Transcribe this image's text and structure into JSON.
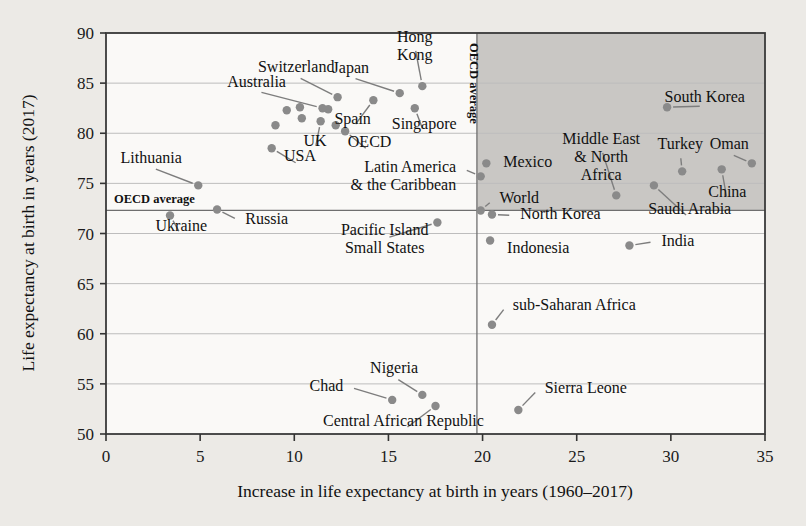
{
  "chart_data": {
    "type": "scatter",
    "title": "",
    "xlabel": "Increase in life expectancy at birth in years (1960–2017)",
    "ylabel": "Life expectancy at birth in years (2017)",
    "xlim": [
      0,
      35
    ],
    "ylim": [
      50,
      90
    ],
    "xticks": [
      0,
      5,
      10,
      15,
      20,
      25,
      30,
      35
    ],
    "yticks": [
      50,
      55,
      60,
      65,
      70,
      75,
      80,
      85,
      90
    ],
    "xtick_labels": [
      "0",
      "5",
      "10",
      "15",
      "20",
      "25",
      "30",
      "35"
    ],
    "ytick_labels": [
      "50",
      "55",
      "60",
      "65",
      "70",
      "75",
      "80",
      "85",
      "90"
    ],
    "grid": "horizontal",
    "legend": "none",
    "reference_lines": [
      {
        "name": "OECD average vertical",
        "axis": "x",
        "value": 19.7,
        "label": "OECD average"
      },
      {
        "name": "OECD average horizontal",
        "axis": "y",
        "value": 72.3,
        "label": "OECD average"
      }
    ],
    "shaded_region": {
      "label": "above both OECD averages",
      "x_range": [
        19.7,
        35
      ],
      "y_range": [
        72.3,
        90
      ],
      "color": "#c9c7c4"
    },
    "points": [
      {
        "label": "Hong Kong",
        "x": 16.8,
        "y": 84.7,
        "lx": 16.4,
        "ly": 89.1,
        "lx2": 16.4,
        "ly2": 87.3,
        "anchor": "middle",
        "l2": "Kong",
        "l1": "Hong"
      },
      {
        "label": "Japan",
        "x": 15.6,
        "y": 84.0,
        "lx": 13.0,
        "ly": 86.0,
        "anchor": "middle"
      },
      {
        "label": "Switzerland",
        "x": 12.3,
        "y": 83.6,
        "lx": 10.1,
        "ly": 86.1,
        "anchor": "middle"
      },
      {
        "label": "Spain",
        "x": 14.2,
        "y": 83.3,
        "lx": 13.1,
        "ly": 80.9,
        "anchor": "middle"
      },
      {
        "label": "Australia",
        "x": 11.5,
        "y": 82.5,
        "lx": 8.0,
        "ly": 84.6,
        "anchor": "middle"
      },
      {
        "label": "South Korea",
        "x": 29.8,
        "y": 82.6,
        "lx": 31.8,
        "ly": 83.1,
        "anchor": "middle"
      },
      {
        "label": "Singapore",
        "x": 16.4,
        "y": 82.5,
        "lx": 16.9,
        "ly": 80.4,
        "anchor": "middle"
      },
      {
        "label": "UK",
        "x": 11.4,
        "y": 81.2,
        "lx": 11.1,
        "ly": 78.7,
        "anchor": "middle"
      },
      {
        "label": "OECD",
        "x": 12.7,
        "y": 80.2,
        "lx": 14.0,
        "ly": 78.6,
        "anchor": "middle"
      },
      {
        "label": "USA",
        "x": 8.8,
        "y": 78.5,
        "lx": 10.3,
        "ly": 77.2,
        "anchor": "middle"
      },
      {
        "label": "Mexico",
        "x": 20.2,
        "y": 77.0,
        "lx": 21.1,
        "ly": 76.6,
        "anchor": "start"
      },
      {
        "label": "Oman",
        "x": 34.3,
        "y": 77.0,
        "lx": 33.1,
        "ly": 78.4,
        "anchor": "middle"
      },
      {
        "label": "Turkey",
        "x": 30.6,
        "y": 76.2,
        "lx": 30.5,
        "ly": 78.4,
        "anchor": "middle"
      },
      {
        "label": "Lithuania",
        "x": 4.9,
        "y": 74.8,
        "lx": 2.4,
        "ly": 77.0,
        "anchor": "middle"
      },
      {
        "label": "China",
        "x": 32.7,
        "y": 76.4,
        "lx": 33.0,
        "ly": 73.6,
        "anchor": "middle"
      },
      {
        "label": "Latin America & the Caribbean",
        "x": 19.9,
        "y": 75.7,
        "lx": 18.6,
        "ly": 76.1,
        "anchor": "end",
        "l1": "Latin America",
        "l2": "& the Caribbean"
      },
      {
        "label": "Middle East & North Africa",
        "x": 27.1,
        "y": 73.8,
        "lx": 26.3,
        "ly": 78.9,
        "anchor": "middle",
        "l1": "Middle East",
        "l2": "& North",
        "l3": "Africa"
      },
      {
        "label": "Saudi Arabia",
        "x": 29.1,
        "y": 74.8,
        "lx": 31.0,
        "ly": 71.9,
        "anchor": "middle"
      },
      {
        "label": "Russia",
        "x": 5.9,
        "y": 72.4,
        "lx": 7.4,
        "ly": 70.9,
        "anchor": "start"
      },
      {
        "label": "World",
        "x": 19.9,
        "y": 72.3,
        "lx": 20.9,
        "ly": 73.0,
        "anchor": "start"
      },
      {
        "label": "Ukraine",
        "x": 3.4,
        "y": 71.8,
        "lx": 4.0,
        "ly": 70.2,
        "anchor": "middle"
      },
      {
        "label": "North Korea",
        "x": 20.5,
        "y": 71.9,
        "lx": 22.0,
        "ly": 71.4,
        "anchor": "start"
      },
      {
        "label": "Pacific Island Small States",
        "x": 17.6,
        "y": 71.1,
        "lx": 14.8,
        "ly": 69.9,
        "anchor": "middle",
        "l1": "Pacific Island",
        "l2": "Small States"
      },
      {
        "label": "Indonesia",
        "x": 20.4,
        "y": 69.3,
        "lx": 21.3,
        "ly": 68.1,
        "anchor": "start"
      },
      {
        "label": "India",
        "x": 27.8,
        "y": 68.8,
        "lx": 29.5,
        "ly": 68.8,
        "anchor": "start"
      },
      {
        "label": "sub-Saharan Africa",
        "x": 20.5,
        "y": 60.9,
        "lx": 21.6,
        "ly": 62.4,
        "anchor": "start"
      },
      {
        "label": "Nigeria",
        "x": 16.8,
        "y": 53.9,
        "lx": 15.3,
        "ly": 56.1,
        "anchor": "middle"
      },
      {
        "label": "Chad",
        "x": 15.2,
        "y": 53.4,
        "lx": 12.6,
        "ly": 54.3,
        "anchor": "end"
      },
      {
        "label": "Central African Republic",
        "x": 17.5,
        "y": 52.8,
        "lx": 15.8,
        "ly": 50.8,
        "anchor": "middle"
      },
      {
        "label": "Sierra Leone",
        "x": 21.9,
        "y": 52.4,
        "lx": 23.3,
        "ly": 54.1,
        "anchor": "start"
      }
    ],
    "unlabeled_points": [
      {
        "x": 10.3,
        "y": 82.6
      },
      {
        "x": 9.6,
        "y": 82.3
      },
      {
        "x": 11.8,
        "y": 82.4
      },
      {
        "x": 9.0,
        "y": 80.8
      },
      {
        "x": 10.4,
        "y": 81.5
      },
      {
        "x": 12.2,
        "y": 80.8
      }
    ]
  },
  "axes": {
    "x_axis_label": "Increase in life expectancy at birth in years (1960–2017)",
    "y_axis_label": "Life expectancy at birth in years (2017)"
  },
  "annotations": {
    "oecd_average_vertical": "OECD average",
    "oecd_average_horizontal": "OECD average"
  }
}
